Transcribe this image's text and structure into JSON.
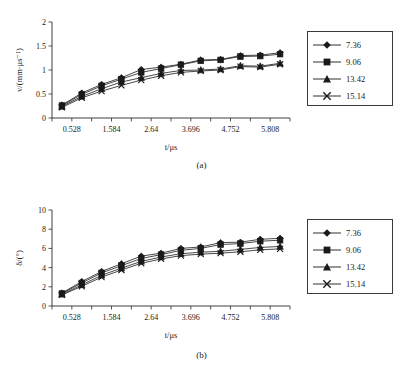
{
  "figure": {
    "caption_a": "(a)",
    "caption_b": "(b)"
  },
  "chart_data": [
    {
      "id": "panel-a",
      "type": "line",
      "title": "",
      "panel_label": "(a)",
      "xlabel": "t/μs",
      "ylabel": "v/(mm·μs⁻¹)",
      "xlim": [
        0.0,
        6.336
      ],
      "ylim": [
        0,
        2
      ],
      "xticks": [
        0.528,
        1.584,
        2.64,
        3.696,
        4.752,
        5.808
      ],
      "xticklabels": [
        "0.528",
        "1.584",
        "2.64",
        "3.696",
        "4.752",
        "5.808"
      ],
      "yticks": [
        0,
        0.5,
        1,
        1.5,
        2
      ],
      "yticklabels": [
        "0",
        "0.5",
        "1",
        "1.5",
        "2"
      ],
      "grid": false,
      "legend_position": "right-outside",
      "x": [
        0.264,
        0.792,
        1.32,
        1.848,
        2.376,
        2.904,
        3.432,
        3.96,
        4.488,
        5.016,
        5.544,
        6.072
      ],
      "series": [
        {
          "name": "7.36",
          "marker": "diamond",
          "values": [
            0.27,
            0.52,
            0.7,
            0.84,
            1.01,
            1.06,
            1.12,
            1.21,
            1.22,
            1.3,
            1.31,
            1.36
          ]
        },
        {
          "name": "9.06",
          "marker": "square",
          "values": [
            0.26,
            0.49,
            0.67,
            0.81,
            0.95,
            1.03,
            1.11,
            1.19,
            1.21,
            1.28,
            1.29,
            1.33
          ]
        },
        {
          "name": "13.42",
          "marker": "triangle",
          "values": [
            0.24,
            0.45,
            0.61,
            0.75,
            0.84,
            0.93,
            0.99,
            1.0,
            1.02,
            1.09,
            1.08,
            1.14
          ]
        },
        {
          "name": "15.14",
          "marker": "cross",
          "values": [
            0.22,
            0.42,
            0.56,
            0.68,
            0.79,
            0.88,
            0.95,
            0.98,
            1.0,
            1.07,
            1.06,
            1.12
          ]
        }
      ]
    },
    {
      "id": "panel-b",
      "type": "line",
      "title": "",
      "panel_label": "(b)",
      "xlabel": "t/μs",
      "ylabel": "δ/(°)",
      "xlim": [
        0.0,
        6.336
      ],
      "ylim": [
        0,
        10
      ],
      "xticks": [
        0.528,
        1.584,
        2.64,
        3.696,
        4.752,
        5.808
      ],
      "xticklabels": [
        "0.528",
        "1.584",
        "2.64",
        "3.696",
        "4.752",
        "5.808"
      ],
      "yticks": [
        0,
        2,
        4,
        6,
        8,
        10
      ],
      "yticklabels": [
        "0",
        "2",
        "4",
        "6",
        "8",
        "10"
      ],
      "grid": false,
      "legend_position": "right-outside",
      "x": [
        0.264,
        0.792,
        1.32,
        1.848,
        2.376,
        2.904,
        3.432,
        3.96,
        4.488,
        5.016,
        5.544,
        6.072
      ],
      "series": [
        {
          "name": "7.36",
          "marker": "diamond",
          "values": [
            1.35,
            2.55,
            3.6,
            4.4,
            5.2,
            5.5,
            6.0,
            6.15,
            6.6,
            6.65,
            6.95,
            7.05
          ]
        },
        {
          "name": "9.06",
          "marker": "square",
          "values": [
            1.3,
            2.4,
            3.45,
            4.2,
            4.95,
            5.35,
            5.8,
            6.0,
            6.4,
            6.5,
            6.75,
            6.85
          ]
        },
        {
          "name": "13.42",
          "marker": "triangle",
          "values": [
            1.22,
            2.2,
            3.2,
            3.95,
            4.65,
            5.1,
            5.45,
            5.6,
            5.7,
            5.9,
            6.1,
            6.2
          ]
        },
        {
          "name": "15.14",
          "marker": "cross",
          "values": [
            1.15,
            2.05,
            3.0,
            3.75,
            4.45,
            4.9,
            5.25,
            5.4,
            5.5,
            5.65,
            5.85,
            5.95
          ]
        }
      ]
    }
  ],
  "legend": {
    "entries": [
      {
        "label": "7.36",
        "marker": "diamond"
      },
      {
        "label": "9.06",
        "marker": "square"
      },
      {
        "label": "13.42",
        "marker": "triangle"
      },
      {
        "label": "15.14",
        "marker": "cross"
      }
    ]
  }
}
